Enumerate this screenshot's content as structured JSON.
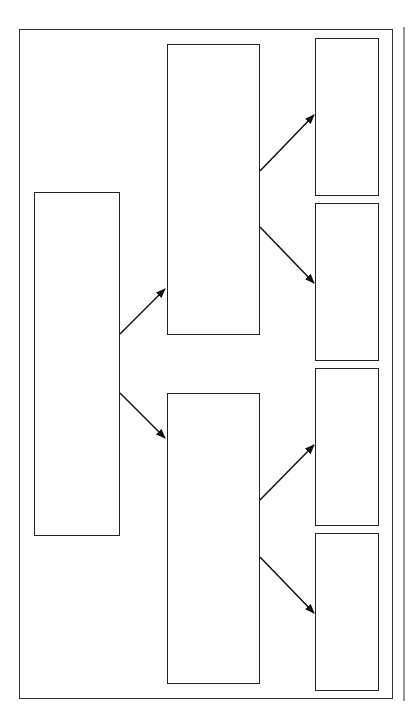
{
  "diagram": {
    "type": "tree",
    "title": "",
    "colors": {
      "stroke": "#222222",
      "background": "#ffffff",
      "side_line": "#999999"
    },
    "frame": {
      "x": 19,
      "y": 29,
      "w": 374,
      "h": 670
    },
    "side_line": {
      "x": 403,
      "y": 27,
      "h": 674
    },
    "nodes": [
      {
        "id": "root",
        "label": "",
        "x": 34,
        "y": 192,
        "w": 86,
        "h": 344
      },
      {
        "id": "mid-top",
        "label": "",
        "x": 167,
        "y": 44,
        "w": 93,
        "h": 291
      },
      {
        "id": "mid-bottom",
        "label": "",
        "x": 167,
        "y": 393,
        "w": 93,
        "h": 291
      },
      {
        "id": "leaf-1",
        "label": "",
        "x": 315,
        "y": 38,
        "w": 64,
        "h": 158
      },
      {
        "id": "leaf-2",
        "label": "",
        "x": 315,
        "y": 203,
        "w": 64,
        "h": 158
      },
      {
        "id": "leaf-3",
        "label": "",
        "x": 315,
        "y": 368,
        "w": 64,
        "h": 158
      },
      {
        "id": "leaf-4",
        "label": "",
        "x": 315,
        "y": 533,
        "w": 64,
        "h": 158
      }
    ],
    "edges": [
      {
        "from": "root",
        "to": "mid-top",
        "x1": 120,
        "y1": 334,
        "x2": 165,
        "y2": 289
      },
      {
        "from": "root",
        "to": "mid-bottom",
        "x1": 120,
        "y1": 393,
        "x2": 165,
        "y2": 438
      },
      {
        "from": "mid-top",
        "to": "leaf-1",
        "x1": 260,
        "y1": 171,
        "x2": 314,
        "y2": 115
      },
      {
        "from": "mid-top",
        "to": "leaf-2",
        "x1": 260,
        "y1": 227,
        "x2": 314,
        "y2": 283
      },
      {
        "from": "mid-bottom",
        "to": "leaf-3",
        "x1": 260,
        "y1": 500,
        "x2": 314,
        "y2": 445
      },
      {
        "from": "mid-bottom",
        "to": "leaf-4",
        "x1": 260,
        "y1": 557,
        "x2": 314,
        "y2": 613
      }
    ]
  }
}
